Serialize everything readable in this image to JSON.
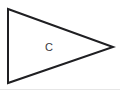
{
  "canvas": {
    "width": 120,
    "height": 90,
    "background_color": "#ffffff",
    "bottom_edge_color": "#e6e6e6"
  },
  "figure": {
    "name": "triangle",
    "stroke_color": "#1f1f22",
    "stroke_width": 2,
    "fill_color": "#ffffff",
    "points": "8,9 113,47 8,83",
    "vertices": [
      {
        "name": "top-left",
        "x": 8,
        "y": 9
      },
      {
        "name": "right-apex",
        "x": 113,
        "y": 47
      },
      {
        "name": "bottom-left",
        "x": 8,
        "y": 83
      }
    ]
  },
  "label": {
    "text": "C",
    "x": 49,
    "y": 47,
    "color": "#3a3a3e",
    "font_size": 11
  }
}
